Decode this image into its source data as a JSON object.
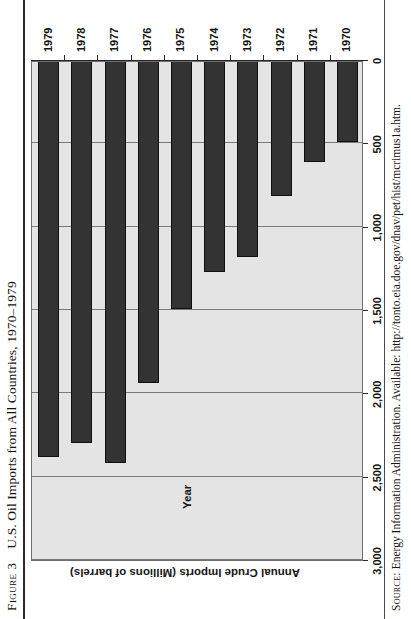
{
  "figure": {
    "number_label": "Figure 3",
    "title": "U.S. Oil Imports from All Countries, 1970–1979",
    "source_label": "Source:",
    "source_text": "Energy Information Administration. Available: http://tonto.eia.doe.gov/dnav/pet/hist/mcrimus1a.htm."
  },
  "axes": {
    "value_axis_title": "Annual Crude Imports (Millions of barrels)",
    "category_axis_title": "Year"
  },
  "colors": {
    "bar_fill": "#333333",
    "bar_border": "#0f0f0f",
    "plot_background": "#e4e4e4",
    "gridline": "#7a7a7a",
    "text": "#141414"
  },
  "chart_data": {
    "type": "bar",
    "orientation": "horizontal",
    "title": "U.S. Oil Imports from All Countries, 1970–1979",
    "xlabel": "Annual Crude Imports (Millions of barrels)",
    "ylabel": "Year",
    "categories": [
      "1970",
      "1971",
      "1972",
      "1973",
      "1974",
      "1975",
      "1976",
      "1977",
      "1978",
      "1979"
    ],
    "values": [
      490,
      610,
      815,
      1185,
      1270,
      1495,
      1940,
      2420,
      2300,
      2385
    ],
    "tick_labels": [
      "0",
      "500",
      "1,000",
      "1,500",
      "2,000",
      "2,500",
      "3,000"
    ],
    "tick_values": [
      0,
      500,
      1000,
      1500,
      2000,
      2500,
      3000
    ],
    "xlim": [
      0,
      3000
    ],
    "grid": true,
    "legend": "none"
  }
}
